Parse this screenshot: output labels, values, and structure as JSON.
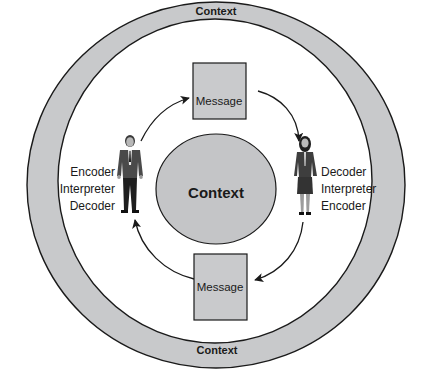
{
  "diagram": {
    "type": "communication-model",
    "outer_ring": {
      "label_top": "Context",
      "label_bottom": "Context"
    },
    "center": {
      "label": "Context"
    },
    "messages": [
      {
        "position": "top",
        "label": "Message"
      },
      {
        "position": "bottom",
        "label": "Message"
      }
    ],
    "participants": [
      {
        "position": "left",
        "figure": "man-in-suit",
        "roles": [
          "Encoder",
          "Interpreter",
          "Decoder"
        ]
      },
      {
        "position": "right",
        "figure": "woman-in-suit",
        "roles": [
          "Decoder",
          "Interpreter",
          "Encoder"
        ]
      }
    ],
    "flow": [
      "left participant -> top message",
      "top message -> right participant",
      "right participant -> bottom message",
      "bottom message -> left participant"
    ],
    "colors": {
      "ring_fill": "#c8c9cb",
      "center_fill": "#c4c5c7",
      "message_fill": "#c9cacc",
      "stroke": "#1a1a1a",
      "background": "#ffffff"
    }
  }
}
